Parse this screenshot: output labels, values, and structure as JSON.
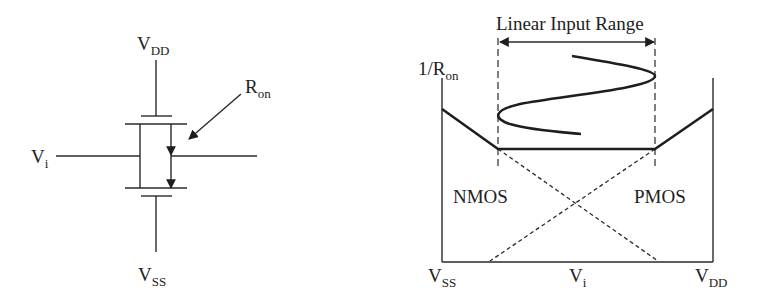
{
  "circuit": {
    "supply_top": {
      "main": "V",
      "sub": "DD"
    },
    "supply_bottom": {
      "main": "V",
      "sub": "SS"
    },
    "input": {
      "main": "V",
      "sub": "i"
    },
    "resistance": {
      "main": "R",
      "sub": "on"
    }
  },
  "graph": {
    "y_axis_label": {
      "main": "1/R",
      "sub": "on"
    },
    "range_label": "Linear Input Range",
    "left_device": "NMOS",
    "right_device": "PMOS",
    "x_left": {
      "main": "V",
      "sub": "SS"
    },
    "x_mid": {
      "main": "V",
      "sub": "i"
    },
    "x_right": {
      "main": "V",
      "sub": "DD"
    }
  }
}
